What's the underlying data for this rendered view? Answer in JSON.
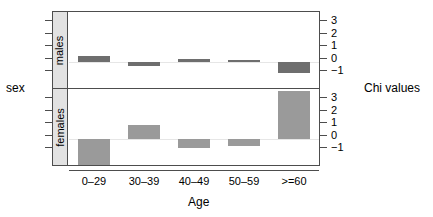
{
  "chart_data": {
    "type": "bar",
    "title": "",
    "xlabel": "Age",
    "ylabel": "Chi values",
    "strip_label": "sex",
    "categories": [
      "0–29",
      "30–39",
      "40–49",
      "50–59",
      ">=60"
    ],
    "ylim": [
      -1.85,
      3.6
    ],
    "yticks": [
      3,
      2,
      1,
      0,
      -1
    ],
    "ytick_labels": [
      "3",
      "2",
      "1",
      "0",
      "−1"
    ],
    "grid": false,
    "legend": "none",
    "panels": [
      {
        "name": "males",
        "label": "males",
        "color": "#6e6e6e",
        "values": [
          0.45,
          -0.3,
          0.2,
          0.15,
          -0.75
        ]
      },
      {
        "name": "females",
        "label": "females",
        "color": "#9a9a9a",
        "values": [
          -1.85,
          1.05,
          -0.6,
          -0.5,
          3.45
        ]
      }
    ]
  },
  "axes": {
    "right_title": "Chi values",
    "left_title": "sex",
    "bottom_title": "Age"
  },
  "ytick_labels": {
    "t0": "3",
    "t1": "2",
    "t2": "1",
    "t3": "0",
    "t4": "−1"
  },
  "xtick_labels": {
    "c0": "0–29",
    "c1": "30–39",
    "c2": "40–49",
    "c3": "50–59",
    "c4": ">=60"
  },
  "strip_labels": {
    "males": "males",
    "females": "females"
  },
  "colors": {
    "male_bar": "#6e6e6e",
    "female_bar": "#9a9a9a",
    "frame": "#4d4d4d",
    "strip_bg": "#e2e2e2",
    "zero_line": "#e6e6e6"
  }
}
